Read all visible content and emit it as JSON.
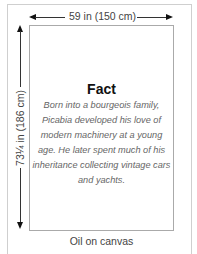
{
  "dimensions": {
    "width_label": "59 in (150 cm)",
    "height_label": "73¼ in (186 cm)"
  },
  "fact": {
    "title": "Fact",
    "body": "Born into a bourgeois family, Picabia developed his love of modern machinery at a young age. He later spent much of his inheritance collecting vintage cars and yachts."
  },
  "medium": "Oil on canvas"
}
